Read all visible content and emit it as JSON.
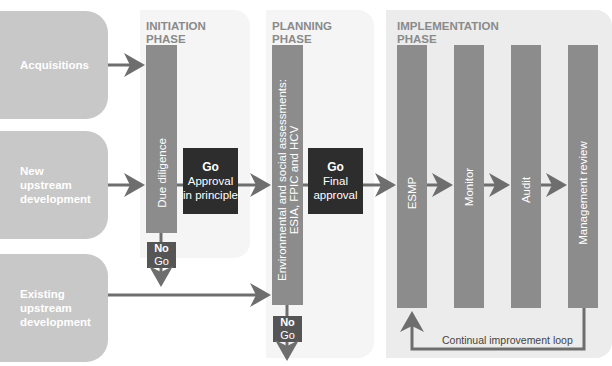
{
  "sources": [
    {
      "label": "Acquisitions"
    },
    {
      "label": "New upstream development",
      "lines": [
        "New",
        "upstream",
        "development"
      ]
    },
    {
      "label": "Existing upstream development",
      "lines": [
        "Existing",
        "upstream",
        "development"
      ]
    }
  ],
  "phases": {
    "initiation": {
      "label_lines": [
        "INITIATION",
        "PHASE"
      ],
      "bar_label": "Due diligence",
      "gate": {
        "title": "Go",
        "lines": [
          "Approval",
          "in principle"
        ]
      },
      "nogo": {
        "line1": "No",
        "line2": "Go"
      }
    },
    "planning": {
      "label_lines": [
        "PLANNING",
        "PHASE"
      ],
      "bar_label_lines": [
        "Environmental and social assessments:",
        "ESIA, FPIC and HCV"
      ],
      "gate": {
        "title": "Go",
        "lines": [
          "Final",
          "approval"
        ]
      },
      "nogo": {
        "line1": "No",
        "line2": "Go"
      }
    },
    "implementation": {
      "label_lines": [
        "IMPLEMENTATION",
        "PHASE"
      ],
      "steps": [
        {
          "label": "ESMP"
        },
        {
          "label": "Monitor"
        },
        {
          "label": "Audit"
        },
        {
          "label": "Management review"
        }
      ],
      "loop_label": "Continual improvement loop"
    }
  },
  "colors": {
    "source_box": "#c8c8c8",
    "bar": "#8c8c8c",
    "gate": "#2d2d2d",
    "nogo": "#555555",
    "arrow": "#6e6e6e",
    "phase_label": "#8a8a8a",
    "phase_bg": "#f5f5f5",
    "impl_bg": "#ececec"
  }
}
